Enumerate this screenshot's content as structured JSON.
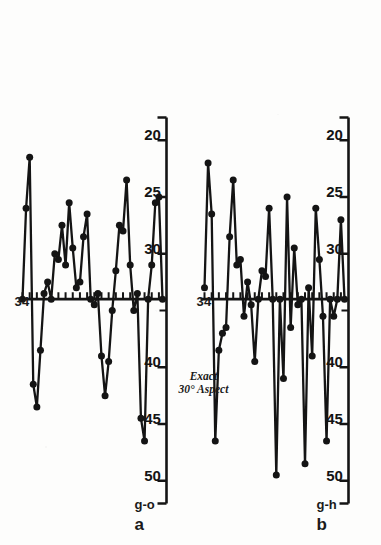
{
  "figure": {
    "center_note_line1": "Exact",
    "center_note_line2": "30° Aspect",
    "panel_a_letter": "a",
    "panel_a_sub": "g-o",
    "panel_b_letter": "b",
    "panel_b_sub": "g-h",
    "reference_label_a": "34",
    "reference_label_b": "34",
    "ink_color": "#141414",
    "paper_color": "#fdfdfc"
  },
  "chart_data": [
    {
      "type": "line",
      "title": "a",
      "subtitle": "g-o",
      "xlabel": "",
      "ylabel": "",
      "grid": false,
      "legend": null,
      "annotations": [
        "Exact 30° Aspect",
        "34"
      ],
      "reference_line": {
        "value": 34,
        "label": "34",
        "orientation": "vertical"
      },
      "axis": {
        "tick_labels": [
          "50",
          "45",
          "40",
          "30",
          "25",
          "20"
        ],
        "tick_values": [
          50,
          45,
          40,
          30,
          25,
          20
        ],
        "minor_tick_step": 1,
        "range": [
          52,
          18
        ],
        "direction": "descending"
      },
      "x": [
        1,
        2,
        3,
        4,
        5,
        6,
        7,
        8,
        9,
        10,
        11,
        12,
        13,
        14,
        15,
        16,
        17,
        18,
        19,
        20,
        21,
        22,
        23,
        24,
        25,
        26,
        27,
        28,
        29,
        30,
        31,
        32,
        33,
        34,
        35,
        36,
        37,
        38,
        39,
        40
      ],
      "values": [
        34.0,
        26.0,
        21.5,
        41.5,
        43.5,
        38.5,
        33.5,
        32.5,
        34.0,
        30.0,
        30.5,
        27.5,
        31.0,
        25.5,
        29.5,
        33.0,
        32.5,
        28.5,
        26.5,
        34.0,
        34.5,
        33.5,
        39.0,
        42.5,
        39.5,
        35.0,
        31.5,
        27.5,
        28.0,
        23.5,
        31.0,
        35.0,
        33.5,
        44.5,
        46.5,
        34.0,
        31.0,
        25.5,
        25.0,
        34.0
      ],
      "series_name": "g-o"
    },
    {
      "type": "line",
      "title": "b",
      "subtitle": "g-h",
      "xlabel": "",
      "ylabel": "",
      "grid": false,
      "legend": null,
      "annotations": [
        "Exact 30° Aspect",
        "34"
      ],
      "reference_line": {
        "value": 34,
        "label": "34",
        "orientation": "vertical"
      },
      "axis": {
        "tick_labels": [
          "50",
          "45",
          "40",
          "30",
          "25",
          "20"
        ],
        "tick_values": [
          50,
          45,
          40,
          30,
          25,
          20
        ],
        "minor_tick_step": 1,
        "range": [
          52,
          18
        ],
        "direction": "descending"
      },
      "x": [
        1,
        2,
        3,
        4,
        5,
        6,
        7,
        8,
        9,
        10,
        11,
        12,
        13,
        14,
        15,
        16,
        17,
        18,
        19,
        20,
        21,
        22,
        23,
        24,
        25,
        26,
        27,
        28,
        29,
        30,
        31,
        32,
        33,
        34,
        35,
        36,
        37,
        38,
        39,
        40
      ],
      "values": [
        33.0,
        22.0,
        26.5,
        46.5,
        38.5,
        37.0,
        36.5,
        28.5,
        23.5,
        31.0,
        30.5,
        35.5,
        32.5,
        34.5,
        39.5,
        34.0,
        31.5,
        32.0,
        26.0,
        34.0,
        49.5,
        34.0,
        41.0,
        25.0,
        36.5,
        29.5,
        34.5,
        34.0,
        48.5,
        33.0,
        39.0,
        26.0,
        30.5,
        35.5,
        46.5,
        34.0,
        35.5,
        34.0,
        27.0,
        34.0
      ],
      "series_name": "g-h"
    }
  ]
}
